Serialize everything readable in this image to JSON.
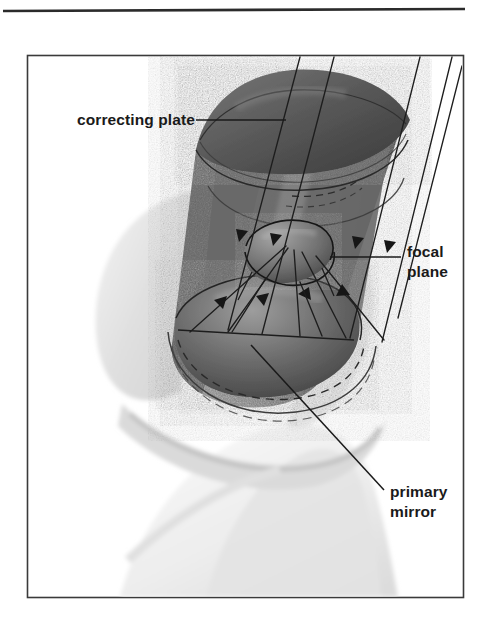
{
  "figure": {
    "kind": "technical-cutaway-illustration",
    "background_color": "#ffffff",
    "frame": {
      "border_color": "#3a3a3a",
      "fill_color": "#ffffff",
      "x": 27,
      "y": 55,
      "width": 436,
      "height": 543
    },
    "top_rule": {
      "color": "#2b2b2b",
      "x1": 3,
      "y1": 11,
      "x2": 465,
      "y2": 9,
      "thickness": 2.4
    }
  },
  "labels": [
    {
      "id": "correcting-plate",
      "name": "correcting plate",
      "lines": [
        "correcting plate"
      ],
      "text_x": 77,
      "text_y": 125,
      "anchor": "start",
      "leader": {
        "x1": 196,
        "y1": 120,
        "x2": 286,
        "y2": 120
      }
    },
    {
      "id": "focal-plane",
      "name": "focal plane",
      "lines": [
        "focal",
        "plane"
      ],
      "text_x": 407,
      "text_y": 257,
      "line_height": 20,
      "anchor": "start",
      "leader": {
        "x1": 330,
        "y1": 257,
        "x2": 401,
        "y2": 257
      }
    },
    {
      "id": "primary-mirror",
      "name": "primary mirror",
      "lines": [
        "primary",
        "mirror"
      ],
      "text_x": 390,
      "text_y": 497,
      "line_height": 20,
      "anchor": "start",
      "leader": {
        "x1": 251,
        "y1": 345,
        "x2": 384,
        "y2": 490
      }
    }
  ],
  "parts": [
    {
      "id": "tube",
      "name": "telescope tube",
      "tone": "#6e6e6e",
      "description": "cylindrical optical tube, cut away along the near side"
    },
    {
      "id": "correcting-plate",
      "name": "correcting plate",
      "tone": "#5e5e5e",
      "description": "domed corrector lens closing the upper aperture of the tube"
    },
    {
      "id": "focal-plane",
      "name": "focal plane",
      "tone": "#7a7a7a",
      "description": "small elliptical disc suspended mid-tube where rays converge"
    },
    {
      "id": "primary-mirror",
      "name": "primary mirror",
      "tone": "#4d4d4d",
      "description": "concave dish mirror at the base of the tube"
    },
    {
      "id": "fork-mount",
      "name": "fork mount yoke",
      "tone": "#e2e2e2",
      "description": "pale grey fork arms cradling the tube"
    },
    {
      "id": "pier-base",
      "name": "mount base / pier",
      "tone": "#ececec",
      "description": "pale grey pedestal beneath the fork"
    },
    {
      "id": "light-rays",
      "name": "incoming light rays",
      "tone": "#1f1f1f",
      "description": "parallel rays entering top-right, reflecting off the primary to the focal plane"
    }
  ],
  "colors": {
    "ink": "#1a1a1a",
    "rule": "#2b2b2b",
    "frame": "#3a3a3a",
    "tube_mid": "#6e6e6e",
    "tube_dark": "#4a4a4a",
    "tube_light": "#9b9b9b",
    "mount_light": "#e6e6e6",
    "mount_shadow": "#c9c9c9",
    "ray": "#222222",
    "paper": "#ffffff"
  }
}
